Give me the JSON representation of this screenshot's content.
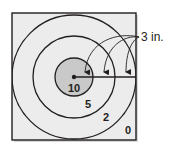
{
  "diagram": {
    "type": "target",
    "units_label": "3 in.",
    "rings": [
      {
        "points": "10",
        "label": "10"
      },
      {
        "points": "5",
        "label": "5"
      },
      {
        "points": "2",
        "label": "2"
      },
      {
        "points": "0",
        "label": "0"
      }
    ],
    "colors": {
      "board": "#ececec",
      "bullseye": "#c9c9c9",
      "stroke": "#231f20"
    }
  }
}
